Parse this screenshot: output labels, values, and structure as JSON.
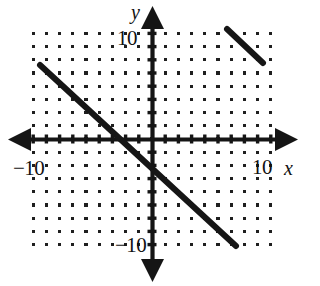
{
  "figure": {
    "kind": "cartesian-coordinate-plane",
    "background_color": "#ffffff",
    "ink_color": "#1a1a1a"
  },
  "axes": {
    "x_variable_label": "x",
    "y_variable_label": "y",
    "x_min_tick_label": "−10",
    "x_max_tick_label": "10",
    "y_min_tick_label": "−10",
    "y_max_tick_label": "10"
  },
  "chart_data": {
    "type": "line",
    "title": "",
    "xlabel": "x",
    "ylabel": "y",
    "xlim": [
      -10,
      10
    ],
    "ylim": [
      -10,
      10
    ],
    "xticks": [
      -10,
      10
    ],
    "yticks": [
      -10,
      10
    ],
    "xtick_labels": [
      "−10",
      "10"
    ],
    "ytick_labels": [
      "−10",
      "10"
    ],
    "grid": "dot-lattice",
    "grid_spacing": 1,
    "legend": "none",
    "series": [
      {
        "name": "main-line",
        "type": "segment",
        "slope": -1,
        "x_intercept": -1.8,
        "y_intercept": -2.0,
        "x": [
          -8.5,
          6.3
        ],
        "y": [
          5.6,
          -8.0
        ],
        "pixel_start": [
          40,
          65
        ],
        "pixel_end": [
          236,
          246
        ],
        "stroke_width": 6
      },
      {
        "name": "upper-right-segment",
        "type": "segment",
        "slope": -1,
        "x": [
          5.7,
          8.3
        ],
        "y": [
          8.3,
          5.8
        ],
        "pixel_start": [
          227,
          29
        ],
        "pixel_end": [
          263,
          63
        ],
        "stroke_width": 6
      }
    ]
  },
  "geometry": {
    "origin_px": [
      152,
      139
    ],
    "unit_px": 13.2,
    "grid_cols": 20,
    "grid_rows": 19,
    "x_axis_left_px": 8,
    "x_axis_right_px": 298,
    "y_axis_top_px": 6,
    "y_axis_bottom_px": 282
  }
}
